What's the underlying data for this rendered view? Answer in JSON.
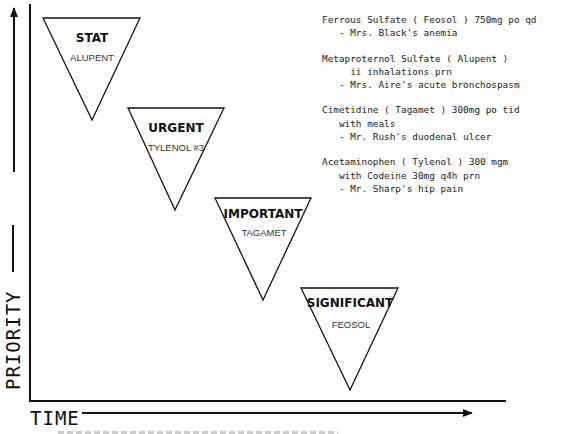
{
  "axes": {
    "y_label": "PRIORITY",
    "x_label": "TIME"
  },
  "triangles": [
    {
      "level": "STAT",
      "drug": "ALUPENT"
    },
    {
      "level": "URGENT",
      "drug": "TYLENOL #3"
    },
    {
      "level": "IMPORTANT",
      "drug": "TAGAMET"
    },
    {
      "level": "SIGNIFICANT",
      "drug": "FEOSOL"
    }
  ],
  "notes": [
    {
      "lines": [
        "Ferrous Sulfate ( Feosol ) 750mg po qd",
        "   - Mrs. Black's anemia"
      ]
    },
    {
      "lines": [
        "Metaproternol Sulfate ( Alupent )",
        "     ii inhalations prn",
        "   - Mrs. Aire's acute bronchospasm"
      ]
    },
    {
      "lines": [
        "Cimetidine ( Tagamet ) 300mg po tid",
        "   with meals",
        "   - Mr. Rush's duodenal ulcer"
      ]
    },
    {
      "lines": [
        "Acetaminophen ( Tylenol ) 300 mgm",
        "   with Codeine 30mg q4h prn",
        "   - Mr. Sharp's hip pain"
      ]
    }
  ],
  "colors": {
    "ink": "#111111",
    "background": "#ffffff"
  }
}
